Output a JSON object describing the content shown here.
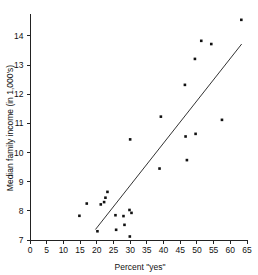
{
  "chart_data": {
    "type": "scatter",
    "title": "",
    "xlabel": "Percent \"yes\"",
    "ylabel": "Median family income (in 1,000's)",
    "xlim": [
      0,
      65
    ],
    "ylim": [
      7,
      14.75
    ],
    "xticks": [
      0,
      5,
      10,
      15,
      20,
      25,
      30,
      35,
      40,
      45,
      50,
      55,
      60,
      65
    ],
    "yticks": [
      7,
      8,
      9,
      10,
      11,
      12,
      13,
      14
    ],
    "xtick_labels": [
      "0",
      "5",
      "10",
      "15",
      "20",
      "25",
      "30",
      "35",
      "40",
      "45",
      "50",
      "55",
      "60",
      "65"
    ],
    "ytick_labels": [
      "7",
      "8",
      "9",
      "10",
      "11",
      "12",
      "13",
      "14"
    ],
    "grid": false,
    "legend": false,
    "points": [
      {
        "x": 14.8,
        "y": 7.83
      },
      {
        "x": 17.0,
        "y": 8.25
      },
      {
        "x": 20.2,
        "y": 7.3
      },
      {
        "x": 21.2,
        "y": 8.22
      },
      {
        "x": 22.2,
        "y": 8.3
      },
      {
        "x": 22.6,
        "y": 8.45
      },
      {
        "x": 23.2,
        "y": 8.65
      },
      {
        "x": 25.6,
        "y": 7.85
      },
      {
        "x": 25.8,
        "y": 7.35
      },
      {
        "x": 28.0,
        "y": 7.82
      },
      {
        "x": 28.3,
        "y": 7.52
      },
      {
        "x": 29.8,
        "y": 8.03
      },
      {
        "x": 29.9,
        "y": 7.12
      },
      {
        "x": 30.4,
        "y": 7.93
      },
      {
        "x": 30.0,
        "y": 10.45
      },
      {
        "x": 38.8,
        "y": 9.45
      },
      {
        "x": 39.2,
        "y": 11.23
      },
      {
        "x": 46.4,
        "y": 12.32
      },
      {
        "x": 46.6,
        "y": 10.55
      },
      {
        "x": 47.0,
        "y": 9.74
      },
      {
        "x": 49.4,
        "y": 13.21
      },
      {
        "x": 49.6,
        "y": 10.64
      },
      {
        "x": 51.3,
        "y": 13.83
      },
      {
        "x": 54.3,
        "y": 13.72
      },
      {
        "x": 57.5,
        "y": 11.12
      },
      {
        "x": 63.3,
        "y": 14.55
      }
    ],
    "fit_line": {
      "x1": 19.6,
      "y1": 7.36,
      "x2": 63.4,
      "y2": 13.72
    },
    "marker": {
      "shape": "square",
      "color": "#111111",
      "size": 2.6
    }
  }
}
